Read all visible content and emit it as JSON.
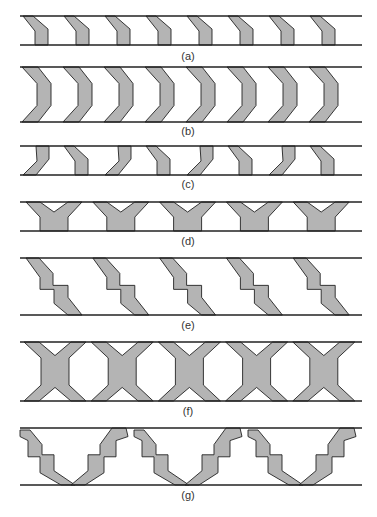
{
  "figure": {
    "colors": {
      "fill": "#b4b4b4",
      "stroke": "#222222",
      "background": "#ffffff"
    },
    "panels": [
      {
        "id": "a",
        "label": "(a)",
        "shape": "slanted-bracket",
        "count": 8,
        "top": 16,
        "bottom": 45,
        "label_y": 50
      },
      {
        "id": "b",
        "label": "(b)",
        "shape": "chevron",
        "count": 8,
        "top": 67,
        "bottom": 122,
        "label_y": 125
      },
      {
        "id": "c",
        "label": "(c)",
        "shape": "alternating-slanted-bracket",
        "count": 8,
        "top": 146,
        "bottom": 175,
        "label_y": 178
      },
      {
        "id": "d",
        "label": "(d)",
        "shape": "Y",
        "count": 5,
        "top": 202,
        "bottom": 231,
        "label_y": 235
      },
      {
        "id": "e",
        "label": "(e)",
        "shape": "stepped-diagonal",
        "count": 5,
        "top": 258,
        "bottom": 315,
        "label_y": 319
      },
      {
        "id": "f",
        "label": "(f)",
        "shape": "X",
        "count": 5,
        "top": 342,
        "bottom": 401,
        "label_y": 405
      },
      {
        "id": "g",
        "label": "(g)",
        "shape": "stepped-V",
        "count": 3,
        "top": 428,
        "bottom": 485,
        "label_y": 489
      }
    ],
    "rail_x": [
      20,
      362
    ]
  }
}
